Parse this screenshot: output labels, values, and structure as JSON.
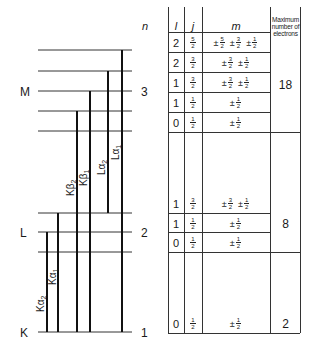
{
  "n_header": "n",
  "shells": [
    {
      "name": "M",
      "n": "3"
    },
    {
      "name": "L",
      "n": "2"
    },
    {
      "name": "K",
      "n": "1"
    }
  ],
  "transitions": [
    {
      "label": "Kα",
      "sub": "2"
    },
    {
      "label": "Kα",
      "sub": "1"
    },
    {
      "label": "Kβ",
      "sub": "2"
    },
    {
      "label": "Kβ",
      "sub": "1"
    },
    {
      "label": "Lα",
      "sub": "2"
    },
    {
      "label": "Lα",
      "sub": "1"
    }
  ],
  "table": {
    "headers": {
      "l": "l",
      "j": "j",
      "m": "m",
      "max": "Maximum number of electrons"
    },
    "rows": [
      {
        "l": "2",
        "j": {
          "num": "5",
          "den": "2"
        },
        "m": [
          [
            "5",
            "2"
          ],
          [
            "3",
            "2"
          ],
          [
            "1",
            "2"
          ]
        ]
      },
      {
        "l": "2",
        "j": {
          "num": "3",
          "den": "2"
        },
        "m": [
          [
            "3",
            "2"
          ],
          [
            "1",
            "2"
          ]
        ]
      },
      {
        "l": "1",
        "j": {
          "num": "3",
          "den": "2"
        },
        "m": [
          [
            "3",
            "2"
          ],
          [
            "1",
            "2"
          ]
        ]
      },
      {
        "l": "1",
        "j": {
          "num": "1",
          "den": "2"
        },
        "m": [
          [
            "1",
            "2"
          ]
        ]
      },
      {
        "l": "0",
        "j": {
          "num": "1",
          "den": "2"
        },
        "m": [
          [
            "1",
            "2"
          ]
        ]
      },
      {
        "l": "1",
        "j": {
          "num": "3",
          "den": "2"
        },
        "m": [
          [
            "3",
            "2"
          ],
          [
            "1",
            "2"
          ]
        ]
      },
      {
        "l": "1",
        "j": {
          "num": "1",
          "den": "2"
        },
        "m": [
          [
            "1",
            "2"
          ]
        ]
      },
      {
        "l": "0",
        "j": {
          "num": "1",
          "den": "2"
        },
        "m": [
          [
            "1",
            "2"
          ]
        ]
      },
      {
        "l": "0",
        "j": {
          "num": "1",
          "den": "2"
        },
        "m": [
          [
            "1",
            "2"
          ]
        ]
      }
    ],
    "max_electrons": [
      "18",
      "8",
      "2"
    ],
    "pm_symbol": "±"
  }
}
